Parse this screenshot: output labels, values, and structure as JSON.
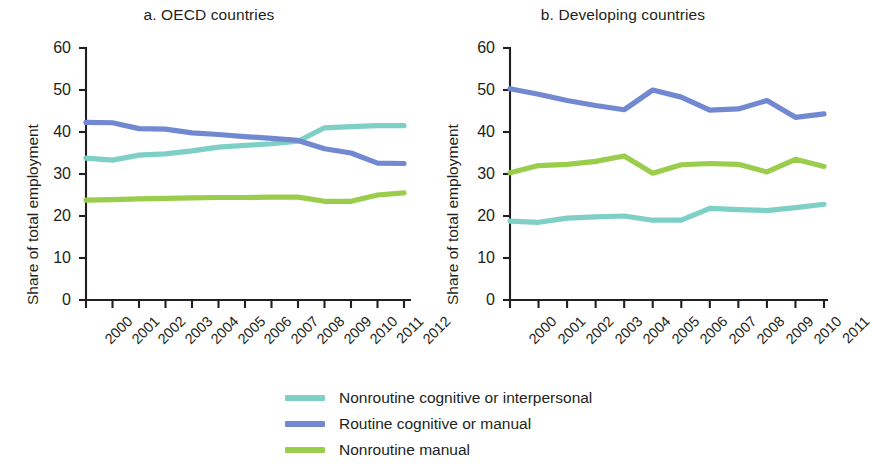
{
  "figure": {
    "ylabel": "Share of total employment",
    "yticks": [
      "0",
      "10",
      "20",
      "30",
      "40",
      "50",
      "60"
    ]
  },
  "colors": {
    "nonroutine_cognitive": "#7ecfc6",
    "routine": "#7289d2",
    "nonroutine_manual": "#9bcd4c",
    "axis": "#231f20",
    "text": "#231f20"
  },
  "legend": {
    "items": [
      {
        "label": "Nonroutine cognitive or interpersonal",
        "color": "#7ecfc6"
      },
      {
        "label": "Routine cognitive or manual",
        "color": "#7289d2"
      },
      {
        "label": "Nonroutine manual",
        "color": "#9bcd4c"
      }
    ]
  },
  "chart_data": [
    {
      "type": "line",
      "panel": "a",
      "title": "a. OECD countries",
      "xlabel": "",
      "ylabel": "Share of total employment",
      "ylim": [
        0,
        60
      ],
      "yticks": [
        0,
        10,
        20,
        30,
        40,
        50,
        60
      ],
      "grid": false,
      "legend_position": "below-figure",
      "categories": [
        "2000",
        "2001",
        "2002",
        "2003",
        "2004",
        "2005",
        "2006",
        "2007",
        "2008",
        "2009",
        "2010",
        "2011",
        "2012"
      ],
      "series": [
        {
          "name": "Nonroutine cognitive or interpersonal",
          "color": "#7ecfc6",
          "values": [
            33.8,
            33.3,
            34.5,
            34.8,
            35.5,
            36.4,
            36.8,
            37.2,
            37.8,
            41.0,
            41.3,
            41.5,
            41.5
          ]
        },
        {
          "name": "Routine cognitive or manual",
          "color": "#7289d2",
          "values": [
            42.3,
            42.2,
            40.8,
            40.7,
            39.8,
            39.4,
            38.9,
            38.5,
            38.0,
            36.0,
            35.0,
            32.6,
            32.5
          ]
        },
        {
          "name": "Nonroutine manual",
          "color": "#9bcd4c",
          "values": [
            23.8,
            23.9,
            24.1,
            24.2,
            24.3,
            24.4,
            24.4,
            24.5,
            24.5,
            23.5,
            23.5,
            25.0,
            25.5
          ]
        }
      ]
    },
    {
      "type": "line",
      "panel": "b",
      "title": "b. Developing countries",
      "xlabel": "",
      "ylabel": "Share of total employment",
      "ylim": [
        0,
        60
      ],
      "yticks": [
        0,
        10,
        20,
        30,
        40,
        50,
        60
      ],
      "grid": false,
      "legend_position": "below-figure",
      "categories": [
        "2000",
        "2001",
        "2002",
        "2003",
        "2004",
        "2005",
        "2006",
        "2007",
        "2008",
        "2009",
        "2010",
        "2011"
      ],
      "series": [
        {
          "name": "Nonroutine cognitive or interpersonal",
          "color": "#7ecfc6",
          "values": [
            18.8,
            18.5,
            19.5,
            19.8,
            20.0,
            19.0,
            19.0,
            21.8,
            21.5,
            21.3,
            22.0,
            22.8
          ]
        },
        {
          "name": "Routine cognitive or manual",
          "color": "#7289d2",
          "values": [
            50.3,
            49.0,
            47.5,
            46.3,
            45.3,
            50.0,
            48.3,
            45.2,
            45.5,
            47.5,
            43.5,
            44.3
          ]
        },
        {
          "name": "Nonroutine manual",
          "color": "#9bcd4c",
          "values": [
            30.3,
            32.0,
            32.3,
            33.0,
            34.3,
            30.2,
            32.2,
            32.5,
            32.3,
            30.5,
            33.5,
            31.8
          ]
        }
      ]
    }
  ]
}
